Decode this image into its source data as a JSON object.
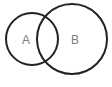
{
  "diagram": {
    "type": "venn",
    "sets": [
      {
        "label": "A",
        "cx": 32,
        "cy": 39,
        "r": 26
      },
      {
        "label": "B",
        "cx": 72,
        "cy": 39,
        "r": 35
      }
    ],
    "stroke_color": "#222222",
    "label_color": "#7a7a7a"
  }
}
